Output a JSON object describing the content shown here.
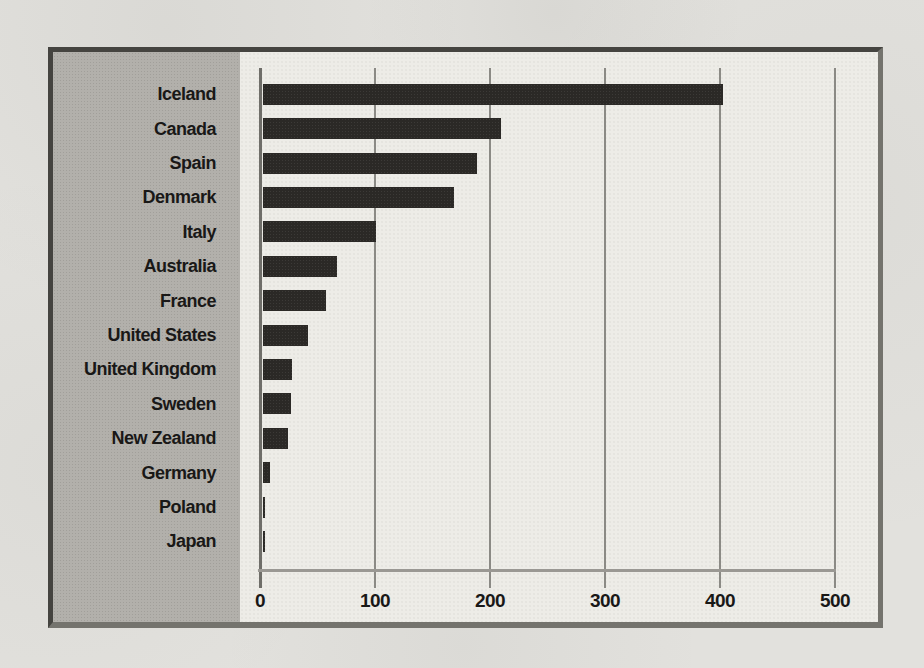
{
  "page": {
    "kind": "scanned-book-page-with-bar-chart"
  },
  "colors": {
    "paper": "#e2e1dd",
    "plot_background": "#edece7",
    "label_panel": "#b2b0ab",
    "bar": "#2b2926",
    "gridline": "#8b8a85",
    "zero_axis": "#6f6e69",
    "frame_dark": "#454440",
    "frame_light": "#74736d",
    "text": "#191817"
  },
  "chart_data": {
    "type": "bar",
    "orientation": "horizontal",
    "title": "",
    "xlabel": "",
    "ylabel": "",
    "categories": [
      "Iceland",
      "Canada",
      "Spain",
      "Denmark",
      "Italy",
      "Australia",
      "France",
      "United States",
      "United Kingdom",
      "Sweden",
      "New Zealand",
      "Germany",
      "Poland",
      "Japan"
    ],
    "values": [
      400,
      207,
      186,
      166,
      98,
      64,
      55,
      39,
      25,
      24,
      22,
      6,
      2,
      1
    ],
    "x_ticks": [
      0,
      100,
      200,
      300,
      400,
      500
    ],
    "x_tick_labels": [
      "0",
      "100",
      "200",
      "300",
      "400",
      "500"
    ],
    "xlim": [
      0,
      500
    ],
    "grid": true,
    "legend": "none",
    "sort_order": "descending"
  }
}
